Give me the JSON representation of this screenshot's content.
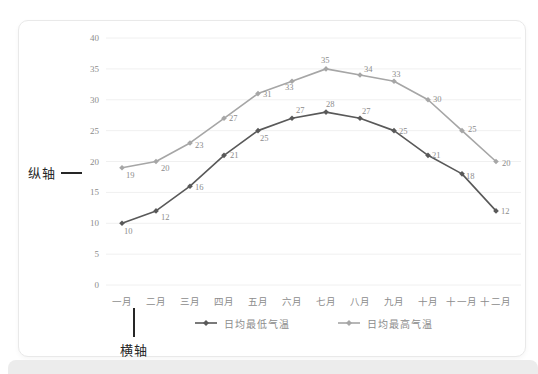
{
  "annotations": {
    "vertical_axis_label": "纵轴",
    "horizontal_axis_label": "横轴"
  },
  "chart_data": {
    "type": "line",
    "title": "",
    "xlabel": "",
    "ylabel": "",
    "categories": [
      "一月",
      "二月",
      "三月",
      "四月",
      "五月",
      "六月",
      "七月",
      "八月",
      "九月",
      "十月",
      "十一月",
      "十二月"
    ],
    "series": [
      {
        "name": "日均最低气温",
        "color": "#595959",
        "values": [
          10,
          12,
          16,
          21,
          25,
          27,
          28,
          27,
          25,
          21,
          18,
          12
        ],
        "label_offsets": [
          [
            2,
            11
          ],
          [
            5,
            9
          ],
          [
            5,
            4
          ],
          [
            6,
            3
          ],
          [
            2,
            10
          ],
          [
            4,
            -5
          ],
          [
            0,
            -5
          ],
          [
            2,
            -4
          ],
          [
            5,
            3
          ],
          [
            4,
            3
          ],
          [
            4,
            5
          ],
          [
            5,
            3
          ]
        ]
      },
      {
        "name": "日均最高气温",
        "color": "#a6a6a6",
        "values": [
          19,
          20,
          23,
          27,
          31,
          33,
          35,
          34,
          33,
          30,
          25,
          20
        ],
        "label_offsets": [
          [
            4,
            10
          ],
          [
            5,
            9
          ],
          [
            5,
            5
          ],
          [
            5,
            3
          ],
          [
            5,
            3
          ],
          [
            -7,
            9
          ],
          [
            -5,
            -6
          ],
          [
            4,
            -3
          ],
          [
            -2,
            -4
          ],
          [
            5,
            2
          ],
          [
            6,
            1
          ],
          [
            6,
            4
          ]
        ]
      }
    ],
    "ylim": [
      0,
      40
    ],
    "y_ticks": [
      0,
      5,
      10,
      15,
      20,
      25,
      30,
      35,
      40
    ],
    "grid": true,
    "legend_position": "bottom",
    "colors": {
      "grid": "#f0f0f0",
      "axis_text": "#8c8c8c",
      "data_label": "#8c8c8c",
      "annotation": "#262626",
      "card_border": "#e9e9e9",
      "bottom_strip": "#ececec"
    }
  }
}
